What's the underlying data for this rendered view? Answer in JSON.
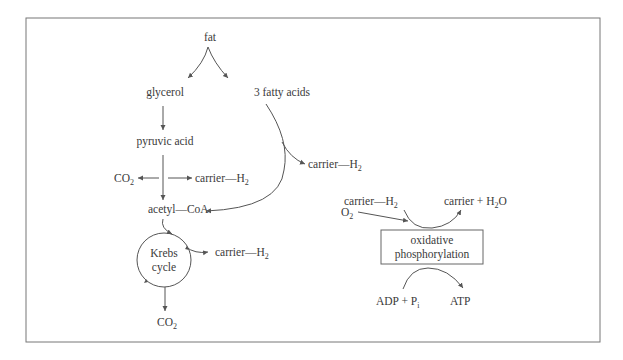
{
  "nodes": {
    "fat": "fat",
    "glycerol": "glycerol",
    "fatty_acids": "3 fatty acids",
    "pyruvic_acid": "pyruvic acid",
    "co2_left": {
      "base": "CO",
      "sub": "2"
    },
    "carrier_h2_pyruvate": {
      "base": "carrier—H",
      "sub": "2"
    },
    "carrier_h2_fatty": {
      "base": "carrier—H",
      "sub": "2"
    },
    "acetyl_coa": "acetyl—CoA",
    "krebs_line1": "Krebs",
    "krebs_line2": "cycle",
    "carrier_h2_krebs": {
      "base": "carrier—H",
      "sub": "2"
    },
    "co2_bottom": {
      "base": "CO",
      "sub": "2"
    },
    "o2": {
      "base": "O",
      "sub": "2"
    },
    "carrier_h2_ox": {
      "base": "carrier—H",
      "sub": "2"
    },
    "carrier_h2o": {
      "pre": "carrier + H",
      "sub": "2",
      "post": "O"
    },
    "ox_line1": "oxidative",
    "ox_line2": "phosphorylation",
    "adp_pi": {
      "base": "ADP + P",
      "sub": "i"
    },
    "atp": "ATP"
  }
}
